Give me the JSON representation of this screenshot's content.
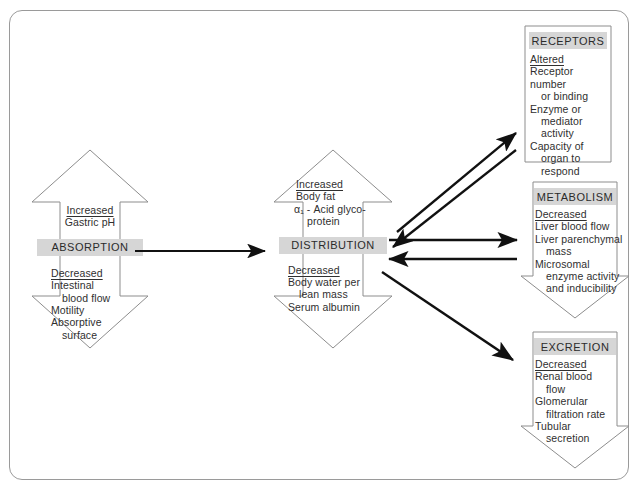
{
  "diagram": {
    "frame_color": "#9a9a9a",
    "band_color": "#d6d6d6",
    "arrow_color": "#111111",
    "outline_color": "#8d8d8d"
  },
  "stages": {
    "absorption": {
      "header": "ABSORPTION",
      "increased_label": "Increased",
      "increased_items": [
        "Gastric pH"
      ],
      "decreased_label": "Decreased",
      "decreased_items": [
        "Intestinal",
        "blood flow",
        "Motility",
        "Absorptive",
        "surface"
      ]
    },
    "distribution": {
      "header": "DISTRIBUTION",
      "increased_label": "Increased",
      "increased_items": [
        "Body fat",
        "α₁ - Acid glyco-",
        "protein"
      ],
      "decreased_label": "Decreased",
      "decreased_items": [
        "Body water per",
        "lean mass",
        "Serum albumin"
      ]
    },
    "receptors": {
      "header": "RECEPTORS",
      "change_label": "Altered",
      "items": [
        "Receptor number",
        "or binding",
        "Enzyme or",
        "mediator",
        "activity",
        "Capacity of",
        "organ to",
        "respond"
      ]
    },
    "metabolism": {
      "header": "METABOLISM",
      "change_label": "Decreased",
      "items": [
        "Liver blood flow",
        "Liver parenchymal",
        "mass",
        "Microsomal",
        "enzyme activity",
        "and inducibility"
      ]
    },
    "excretion": {
      "header": "EXCRETION",
      "change_label": "Decreased",
      "items": [
        "Renal blood",
        "flow",
        "Glomerular",
        "filtration rate",
        "Tubular",
        "secretion"
      ]
    }
  },
  "connectors": [
    {
      "name": "absorption-to-distribution",
      "from": "ABSORPTION",
      "to": "DISTRIBUTION",
      "direction": "right"
    },
    {
      "name": "distribution-to-receptors",
      "from": "DISTRIBUTION",
      "to": "RECEPTORS",
      "direction": "bidirectional"
    },
    {
      "name": "distribution-to-metabolism",
      "from": "DISTRIBUTION",
      "to": "METABOLISM",
      "direction": "bidirectional"
    },
    {
      "name": "distribution-to-excretion",
      "from": "DISTRIBUTION",
      "to": "EXCRETION",
      "direction": "right"
    }
  ]
}
